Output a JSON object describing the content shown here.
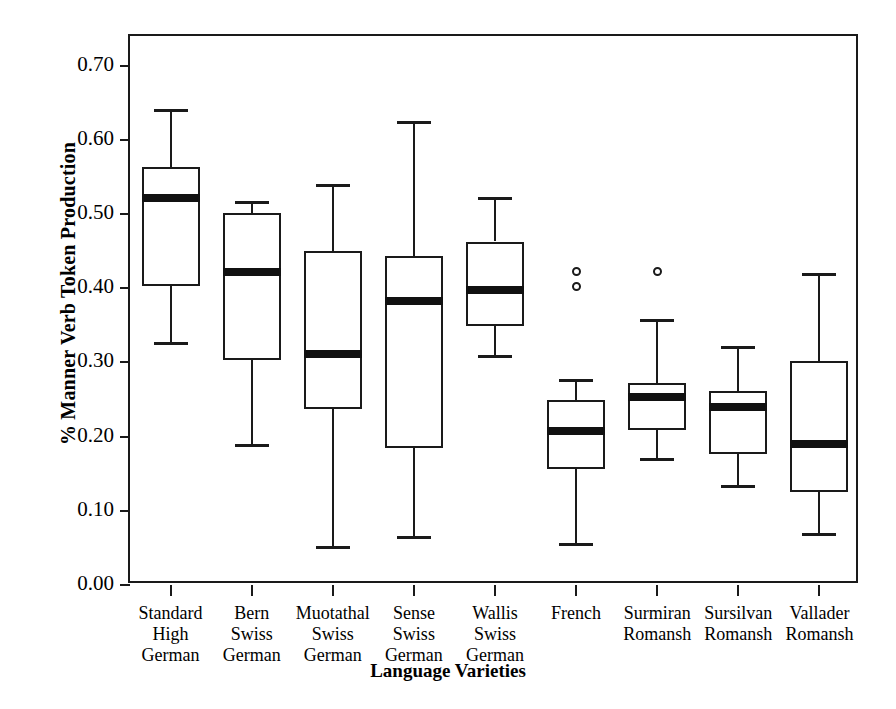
{
  "chart_data": {
    "type": "box",
    "title": "",
    "xlabel": "Language Varieties",
    "ylabel": "% Manner Verb Token Production",
    "ylim": [
      0.0,
      0.74
    ],
    "ytick_values": [
      0.0,
      0.1,
      0.2,
      0.3,
      0.4,
      0.5,
      0.6,
      0.7
    ],
    "ytick_labels": [
      "0.00",
      "0.10",
      "0.20",
      "0.30",
      "0.40",
      "0.50",
      "0.60",
      "0.70"
    ],
    "grid": false,
    "legend": "none",
    "categories": [
      "Standard\nHigh\nGerman",
      "Bern\nSwiss\nGerman",
      "Muotathal\nSwiss\nGerman",
      "Sense\nSwiss\nGerman",
      "Wallis\nSwiss\nGerman",
      "French",
      "Surmiran\nRomansh",
      "Sursilvan\nRomansh",
      "Vallader\nRomansh"
    ],
    "boxes": [
      {
        "category": "Standard High German",
        "whisker_low": 0.325,
        "q1": 0.403,
        "median": 0.522,
        "q3": 0.563,
        "whisker_high": 0.642,
        "outliers": []
      },
      {
        "category": "Bern Swiss German",
        "whisker_low": 0.188,
        "q1": 0.303,
        "median": 0.422,
        "q3": 0.501,
        "whisker_high": 0.518,
        "outliers": []
      },
      {
        "category": "Muotathal Swiss German",
        "whisker_low": 0.05,
        "q1": 0.237,
        "median": 0.312,
        "q3": 0.45,
        "whisker_high": 0.54,
        "outliers": []
      },
      {
        "category": "Sense Swiss German",
        "whisker_low": 0.063,
        "q1": 0.184,
        "median": 0.383,
        "q3": 0.443,
        "whisker_high": 0.626,
        "outliers": []
      },
      {
        "category": "Wallis Swiss German",
        "whisker_low": 0.307,
        "q1": 0.349,
        "median": 0.397,
        "q3": 0.463,
        "whisker_high": 0.523,
        "outliers": []
      },
      {
        "category": "French",
        "whisker_low": 0.054,
        "q1": 0.157,
        "median": 0.207,
        "q3": 0.25,
        "whisker_high": 0.277,
        "outliers": [
          0.422,
          0.403
        ]
      },
      {
        "category": "Surmiran Romansh",
        "whisker_low": 0.168,
        "q1": 0.209,
        "median": 0.253,
        "q3": 0.272,
        "whisker_high": 0.358,
        "outliers": [
          0.423
        ]
      },
      {
        "category": "Sursilvan Romansh",
        "whisker_low": 0.132,
        "q1": 0.176,
        "median": 0.24,
        "q3": 0.262,
        "whisker_high": 0.322,
        "outliers": []
      },
      {
        "category": "Vallader Romansh",
        "whisker_low": 0.067,
        "q1": 0.125,
        "median": 0.19,
        "q3": 0.302,
        "whisker_high": 0.42,
        "outliers": []
      }
    ],
    "colors": {
      "line": "#1a1a1a",
      "median": "#111111",
      "fill": "#ffffff",
      "background": "#ffffff"
    }
  }
}
